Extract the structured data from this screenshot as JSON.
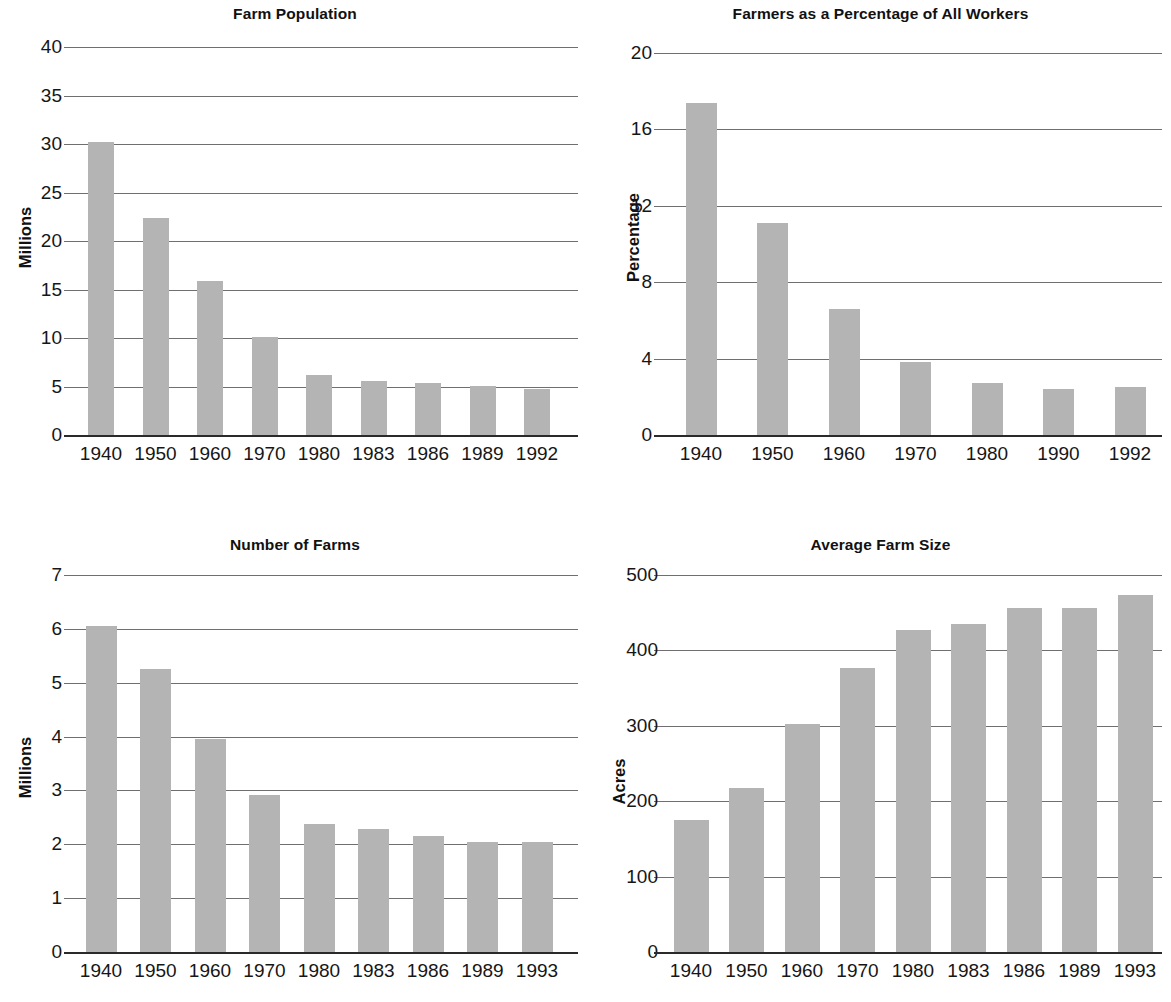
{
  "page": {
    "background_color": "#ffffff",
    "bar_color": "#b4b4b4",
    "gridline_color": "#6f6f6f",
    "axis_color": "#2a2a2a",
    "text_color": "#161616"
  },
  "charts": [
    {
      "id": "farm-population",
      "title": "Farm Population",
      "ylabel": "Millions",
      "xlabel": "",
      "ytick_labels": [
        "0",
        "5",
        "10",
        "15",
        "20",
        "25",
        "30",
        "35",
        "40"
      ],
      "xtick_labels": [
        "1940",
        "1950",
        "1960",
        "1970",
        "1980",
        "1983",
        "1986",
        "1989",
        "1992"
      ]
    },
    {
      "id": "farmers-percentage",
      "title": "Farmers as a Percentage of All Workers",
      "ylabel": "Percentage",
      "xlabel": "",
      "ytick_labels": [
        "0",
        "4",
        "8",
        "12",
        "16",
        "20"
      ],
      "xtick_labels": [
        "1940",
        "1950",
        "1960",
        "1970",
        "1980",
        "1990",
        "1992"
      ]
    },
    {
      "id": "number-of-farms",
      "title": "Number of Farms",
      "ylabel": "Millions",
      "xlabel": "",
      "ytick_labels": [
        "0",
        "1",
        "2",
        "3",
        "4",
        "5",
        "6",
        "7"
      ],
      "xtick_labels": [
        "1940",
        "1950",
        "1960",
        "1970",
        "1980",
        "1983",
        "1986",
        "1989",
        "1993"
      ]
    },
    {
      "id": "average-farm-size",
      "title": "Average Farm Size",
      "ylabel": "Acres",
      "xlabel": "",
      "ytick_labels": [
        "0",
        "100",
        "200",
        "300",
        "400",
        "500"
      ],
      "xtick_labels": [
        "1940",
        "1950",
        "1960",
        "1970",
        "1980",
        "1983",
        "1986",
        "1989",
        "1993"
      ]
    }
  ],
  "chart_data": [
    {
      "type": "bar",
      "id": "farm-population",
      "title": "Farm Population",
      "xlabel": "",
      "ylabel": "Millions",
      "categories": [
        "1940",
        "1950",
        "1960",
        "1970",
        "1980",
        "1983",
        "1986",
        "1989",
        "1992"
      ],
      "values": [
        30.2,
        22.4,
        15.9,
        10.1,
        6.2,
        5.6,
        5.4,
        5.1,
        4.7
      ],
      "ylim": [
        0,
        40
      ],
      "yticks": [
        0,
        5,
        10,
        15,
        20,
        25,
        30,
        35,
        40
      ],
      "grid": true,
      "legend": null
    },
    {
      "type": "bar",
      "id": "farmers-percentage",
      "title": "Farmers as a Percentage of All Workers",
      "xlabel": "",
      "ylabel": "Percentage",
      "categories": [
        "1940",
        "1950",
        "1960",
        "1970",
        "1980",
        "1990",
        "1992"
      ],
      "values": [
        17.4,
        11.1,
        6.6,
        3.8,
        2.7,
        2.4,
        2.5
      ],
      "ylim": [
        0,
        20
      ],
      "yticks": [
        0,
        4,
        8,
        12,
        16,
        20
      ],
      "grid": true,
      "legend": null
    },
    {
      "type": "bar",
      "id": "number-of-farms",
      "title": "Number of Farms",
      "xlabel": "",
      "ylabel": "Millions",
      "categories": [
        "1940",
        "1950",
        "1960",
        "1970",
        "1980",
        "1983",
        "1986",
        "1989",
        "1993"
      ],
      "values": [
        6.05,
        5.25,
        3.95,
        2.92,
        2.37,
        2.29,
        2.16,
        2.05,
        2.05
      ],
      "ylim": [
        0,
        7
      ],
      "yticks": [
        0,
        1,
        2,
        3,
        4,
        5,
        6,
        7
      ],
      "grid": true,
      "legend": null
    },
    {
      "type": "bar",
      "id": "average-farm-size",
      "title": "Average Farm Size",
      "xlabel": "",
      "ylabel": "Acres",
      "categories": [
        "1940",
        "1950",
        "1960",
        "1970",
        "1980",
        "1983",
        "1986",
        "1989",
        "1993"
      ],
      "values": [
        175,
        218,
        302,
        377,
        427,
        435,
        456,
        456,
        473
      ],
      "ylim": [
        0,
        500
      ],
      "yticks": [
        0,
        100,
        200,
        300,
        400,
        500
      ],
      "grid": true,
      "legend": null
    }
  ]
}
